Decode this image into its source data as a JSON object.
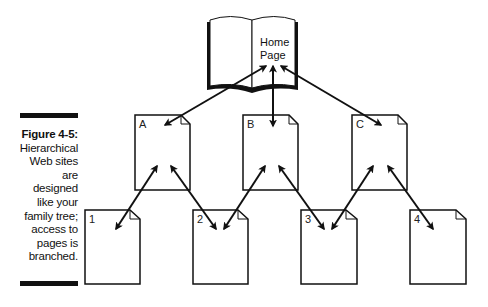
{
  "caption": {
    "figure_label": "Figure 4-5:",
    "lines": [
      "Hierarchical",
      "Web sites",
      "are",
      "designed",
      "like your",
      "family tree;",
      "access to",
      "pages is",
      "branched."
    ]
  },
  "diagram": {
    "root": {
      "line1": "Home",
      "line2": "Page",
      "icon": "open-book-icon"
    },
    "level1": [
      {
        "label": "A",
        "icon": "document-icon"
      },
      {
        "label": "B",
        "icon": "document-icon"
      },
      {
        "label": "C",
        "icon": "document-icon"
      }
    ],
    "level2": [
      {
        "label": "1",
        "icon": "document-icon"
      },
      {
        "label": "2",
        "icon": "document-icon"
      },
      {
        "label": "3",
        "icon": "document-icon"
      },
      {
        "label": "4",
        "icon": "document-icon"
      }
    ],
    "connections": [
      [
        "Home Page",
        "A"
      ],
      [
        "Home Page",
        "B"
      ],
      [
        "Home Page",
        "C"
      ],
      [
        "A",
        "1"
      ],
      [
        "A",
        "2"
      ],
      [
        "B",
        "2"
      ],
      [
        "B",
        "3"
      ],
      [
        "C",
        "3"
      ],
      [
        "C",
        "4"
      ]
    ],
    "colors": {
      "stroke": "#111111",
      "background": "#ffffff"
    }
  }
}
